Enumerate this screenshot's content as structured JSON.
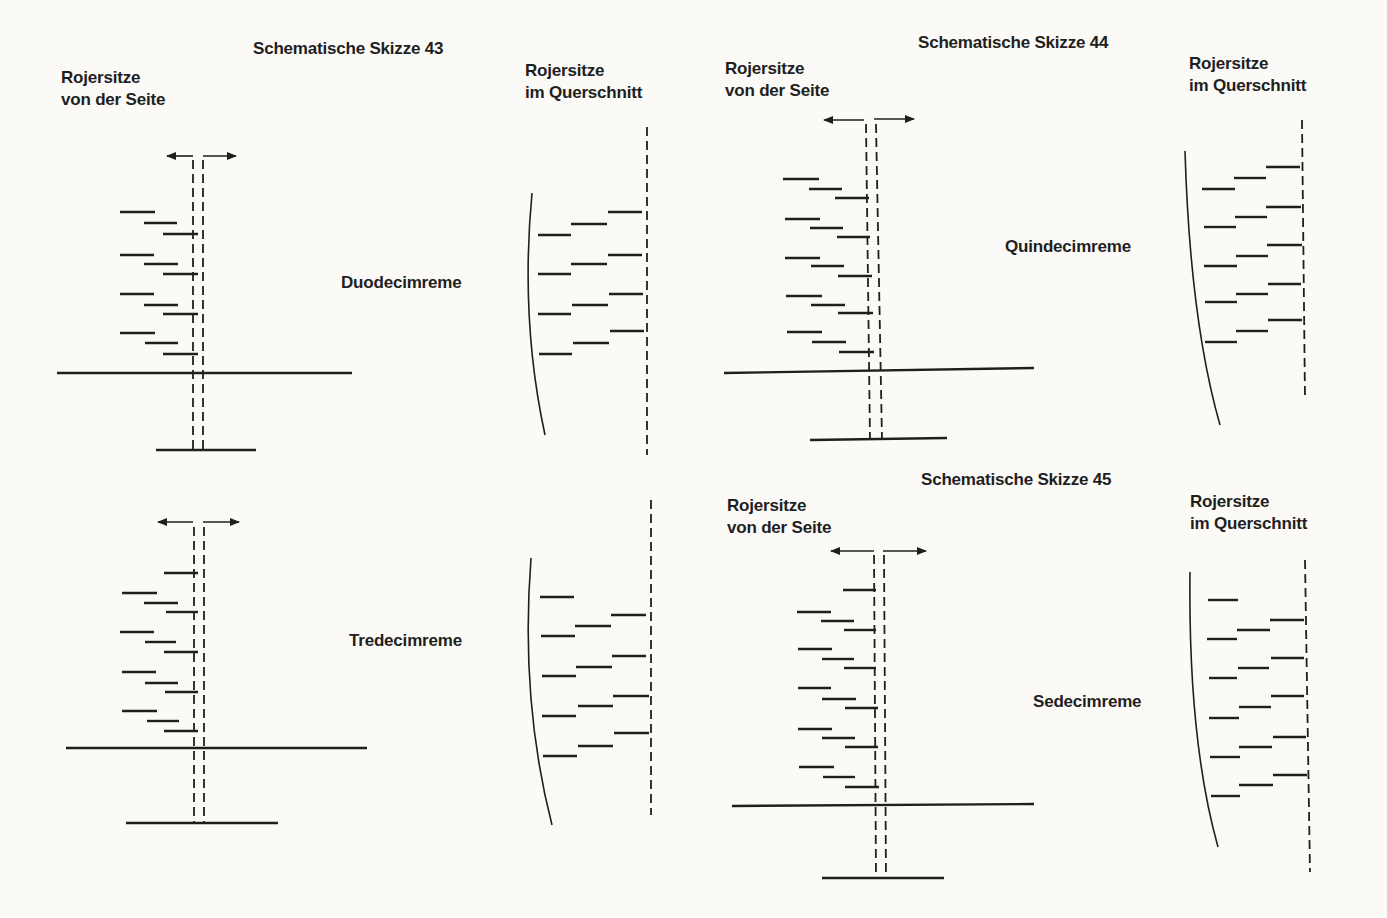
{
  "sketches": [
    {
      "title": "Schematische Skizze 43",
      "side_label_1": "Rojersitze",
      "side_label_2": "von der Seite",
      "section_label_1": "Rojersitze",
      "section_label_2": "im Querschnitt",
      "ships": [
        "Duodecimreme",
        "Tredecimreme"
      ]
    },
    {
      "title": "Schematische Skizze 44",
      "side_label_1": "Rojersitze",
      "side_label_2": "von der Seite",
      "section_label_1": "Rojersitze",
      "section_label_2": "im Querschnitt",
      "ships": [
        "Quindecimreme"
      ]
    },
    {
      "title": "Schematische Skizze 45",
      "side_label_1": "Rojersitze",
      "side_label_2": "von der Seite",
      "section_label_1": "Rojersitze",
      "section_label_2": "im Querschnitt",
      "ships": [
        "Sedecimreme"
      ]
    }
  ],
  "colors": {
    "ink": "#1f1f1f",
    "paper": "#fbfaf6"
  }
}
